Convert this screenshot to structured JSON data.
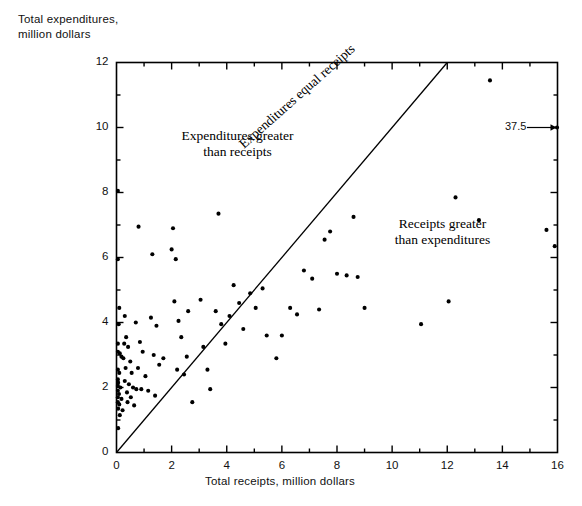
{
  "figure": {
    "kind": "scatterplot",
    "background_color": "#ffffff",
    "ink_color": "#000000"
  },
  "axes": {
    "y_title": "Total expenditures,\nmillion dollars",
    "x_title": "Total receipts, million dollars",
    "x_ticks": [
      "0",
      "2",
      "4",
      "6",
      "8",
      "10",
      "12",
      "14",
      "16"
    ],
    "y_ticks": [
      "0",
      "2",
      "4",
      "6",
      "8",
      "10",
      "12"
    ]
  },
  "annotations": {
    "upper_region": "Expenditures greater\nthan receipts",
    "lower_region": "Receipts greater\nthan expenditures",
    "diagonal_line": "Expenditures equal receipts",
    "outlier_callout": "37.5"
  },
  "chart_data": {
    "type": "scatter",
    "title": "",
    "xlabel": "Total receipts, million dollars",
    "ylabel": "Total expenditures, million dollars",
    "xlim": [
      0,
      16
    ],
    "ylim": [
      0,
      12
    ],
    "x_major_ticks": [
      0,
      2,
      4,
      6,
      8,
      10,
      12,
      14,
      16
    ],
    "y_major_ticks": [
      0,
      2,
      4,
      6,
      8,
      10,
      12
    ],
    "x_minor_tick_step": 1,
    "y_minor_tick_step": 1,
    "grid": false,
    "legend": "none",
    "reference_line": {
      "label": "Expenditures equal receipts",
      "from": [
        0,
        0
      ],
      "to": [
        12,
        12
      ],
      "slope": 1,
      "intercept": 0
    },
    "annotations": [
      {
        "text": "Expenditures greater\nthan receipts",
        "x": 3.6,
        "y": 10.0
      },
      {
        "text": "Receipts greater\nthan expenditures",
        "x": 11.0,
        "y": 7.3
      },
      {
        "text": "37.5",
        "x": 16.0,
        "y": 10.0,
        "note": "callout pointing to clipped point whose receipts value is 37.5"
      }
    ],
    "marker": {
      "shape": "circle",
      "size_px": 3.2,
      "color": "#000000"
    },
    "points": [
      [
        0.05,
        8.05
      ],
      [
        0.05,
        5.95
      ],
      [
        0.1,
        4.45
      ],
      [
        0.08,
        3.95
      ],
      [
        0.05,
        3.35
      ],
      [
        0.05,
        3.1
      ],
      [
        0.12,
        3.05
      ],
      [
        0.18,
        2.95
      ],
      [
        0.05,
        2.55
      ],
      [
        0.1,
        2.45
      ],
      [
        0.05,
        2.25
      ],
      [
        0.06,
        2.15
      ],
      [
        0.05,
        2.05
      ],
      [
        0.14,
        2.0
      ],
      [
        0.05,
        1.9
      ],
      [
        0.09,
        1.8
      ],
      [
        0.05,
        1.7
      ],
      [
        0.18,
        1.65
      ],
      [
        0.05,
        1.55
      ],
      [
        0.1,
        1.48
      ],
      [
        0.06,
        1.35
      ],
      [
        0.22,
        1.3
      ],
      [
        0.12,
        1.15
      ],
      [
        0.06,
        0.75
      ],
      [
        0.3,
        4.2
      ],
      [
        0.35,
        3.55
      ],
      [
        0.28,
        3.35
      ],
      [
        0.42,
        3.25
      ],
      [
        0.25,
        2.9
      ],
      [
        0.5,
        2.8
      ],
      [
        0.33,
        2.6
      ],
      [
        0.55,
        2.45
      ],
      [
        0.3,
        2.2
      ],
      [
        0.45,
        2.1
      ],
      [
        0.6,
        2.0
      ],
      [
        0.72,
        1.95
      ],
      [
        0.38,
        1.85
      ],
      [
        0.52,
        1.7
      ],
      [
        0.4,
        1.55
      ],
      [
        0.64,
        1.45
      ],
      [
        0.8,
        6.95
      ],
      [
        0.7,
        4.0
      ],
      [
        0.85,
        3.4
      ],
      [
        0.95,
        3.1
      ],
      [
        0.78,
        2.6
      ],
      [
        1.05,
        2.35
      ],
      [
        0.9,
        1.95
      ],
      [
        1.15,
        1.9
      ],
      [
        1.3,
        6.1
      ],
      [
        1.25,
        4.15
      ],
      [
        1.45,
        3.9
      ],
      [
        1.35,
        3.0
      ],
      [
        1.55,
        2.7
      ],
      [
        1.4,
        1.75
      ],
      [
        1.7,
        2.9
      ],
      [
        2.05,
        6.9
      ],
      [
        2.0,
        6.25
      ],
      [
        2.15,
        5.95
      ],
      [
        2.1,
        4.65
      ],
      [
        2.25,
        4.05
      ],
      [
        2.35,
        3.55
      ],
      [
        2.2,
        2.55
      ],
      [
        2.45,
        2.4
      ],
      [
        2.6,
        4.35
      ],
      [
        2.55,
        2.95
      ],
      [
        2.75,
        1.55
      ],
      [
        3.05,
        4.7
      ],
      [
        3.15,
        3.25
      ],
      [
        3.3,
        2.55
      ],
      [
        3.4,
        1.95
      ],
      [
        3.7,
        7.35
      ],
      [
        3.6,
        4.35
      ],
      [
        3.8,
        3.95
      ],
      [
        3.95,
        3.35
      ],
      [
        4.25,
        5.15
      ],
      [
        4.1,
        4.2
      ],
      [
        4.45,
        4.6
      ],
      [
        4.6,
        3.8
      ],
      [
        4.85,
        4.9
      ],
      [
        5.05,
        4.45
      ],
      [
        5.3,
        5.05
      ],
      [
        5.45,
        3.6
      ],
      [
        5.8,
        2.9
      ],
      [
        6.0,
        3.6
      ],
      [
        6.3,
        4.45
      ],
      [
        6.55,
        4.25
      ],
      [
        6.8,
        5.6
      ],
      [
        7.1,
        5.35
      ],
      [
        7.35,
        4.4
      ],
      [
        7.55,
        6.55
      ],
      [
        7.75,
        6.8
      ],
      [
        8.0,
        5.5
      ],
      [
        8.35,
        5.45
      ],
      [
        8.6,
        7.25
      ],
      [
        8.75,
        5.4
      ],
      [
        9.0,
        4.45
      ],
      [
        11.05,
        3.95
      ],
      [
        12.05,
        4.65
      ],
      [
        12.3,
        7.85
      ],
      [
        13.15,
        7.15
      ],
      [
        13.55,
        11.45
      ],
      [
        15.6,
        6.85
      ],
      [
        15.9,
        6.35
      ],
      [
        16.0,
        10.0
      ]
    ]
  }
}
